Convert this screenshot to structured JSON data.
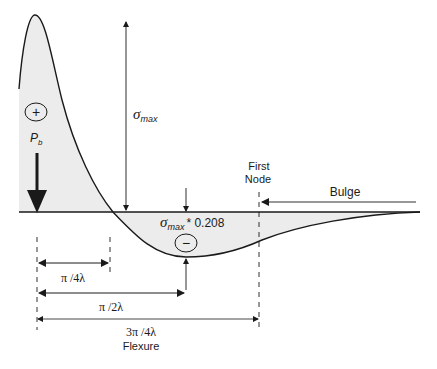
{
  "diagram": {
    "labels": {
      "sigma_max_symbol": "σ",
      "sigma_max_sub": "max",
      "sigma_min_symbol": "σ",
      "sigma_min_sub": "max",
      "sigma_min_factor": "* 0.208",
      "load_symbol": "P",
      "load_sub": "b",
      "plus_sign": "+",
      "minus_sign": "−",
      "first_node_line1": "First",
      "first_node_line2": "Node",
      "bulge": "Bulge",
      "dim_quarter": "π /4λ",
      "dim_half": "π /2λ",
      "dim_three_quarter": "3π /4λ",
      "flexure": "Flexure"
    },
    "colors": {
      "fill": "#ececec",
      "line": "#1a1a1a"
    }
  }
}
